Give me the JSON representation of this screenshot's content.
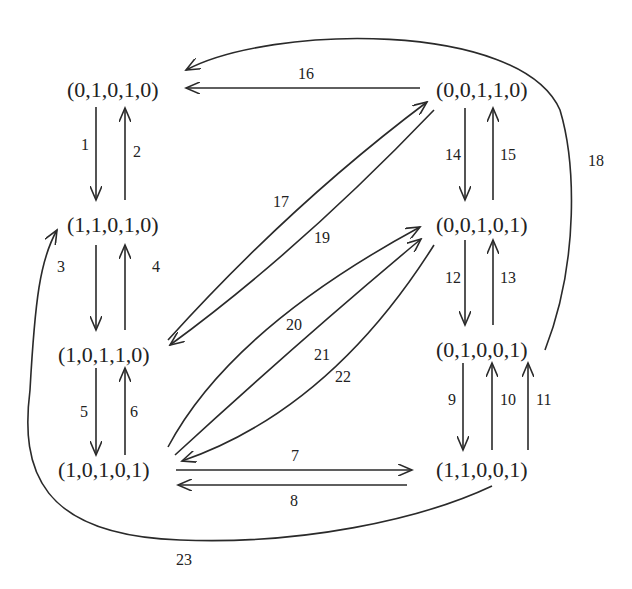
{
  "diagram": {
    "type": "state-transition-graph",
    "nodes": [
      {
        "id": "n01010",
        "label": "(0,1,0,1,0)",
        "x": 140,
        "y": 90
      },
      {
        "id": "n11010",
        "label": "(1,1,0,1,0)",
        "x": 140,
        "y": 225
      },
      {
        "id": "n10110",
        "label": "(1,0,1,1,0)",
        "x": 110,
        "y": 355
      },
      {
        "id": "n10101",
        "label": "(1,0,1,0,1)",
        "x": 110,
        "y": 470
      },
      {
        "id": "n00110",
        "label": "(0,0,1,1,0)",
        "x": 490,
        "y": 90
      },
      {
        "id": "n00101",
        "label": "(0,0,1,0,1)",
        "x": 490,
        "y": 225
      },
      {
        "id": "n01001",
        "label": "(0,1,0,0,1)",
        "x": 490,
        "y": 350
      },
      {
        "id": "n11001",
        "label": "(1,1,0,0,1)",
        "x": 490,
        "y": 470
      }
    ],
    "edges": [
      {
        "id": 1,
        "label": "1",
        "from": "(0,1,0,1,0)",
        "to": "(1,1,0,1,0)"
      },
      {
        "id": 2,
        "label": "2",
        "from": "(1,1,0,1,0)",
        "to": "(0,1,0,1,0)"
      },
      {
        "id": 3,
        "label": "3",
        "from": "(1,1,0,0,1)",
        "to": "(1,1,0,1,0)"
      },
      {
        "id": 4,
        "label": "4",
        "from": "(1,0,1,1,0)",
        "to": "(1,1,0,1,0)"
      },
      {
        "id": 5,
        "label": "5",
        "from": "(1,0,1,1,0)",
        "to": "(1,0,1,0,1)"
      },
      {
        "id": 6,
        "label": "6",
        "from": "(1,0,1,0,1)",
        "to": "(1,0,1,1,0)"
      },
      {
        "id": 7,
        "label": "7",
        "from": "(1,0,1,0,1)",
        "to": "(1,1,0,0,1)"
      },
      {
        "id": 8,
        "label": "8",
        "from": "(1,1,0,0,1)",
        "to": "(1,0,1,0,1)"
      },
      {
        "id": 9,
        "label": "9",
        "from": "(0,1,0,0,1)",
        "to": "(1,1,0,0,1)"
      },
      {
        "id": 10,
        "label": "10",
        "from": "(1,1,0,0,1)",
        "to": "(0,1,0,0,1)"
      },
      {
        "id": 11,
        "label": "11",
        "from": "(1,1,0,0,1)",
        "to": "(0,1,0,0,1)"
      },
      {
        "id": 12,
        "label": "12",
        "from": "(0,0,1,0,1)",
        "to": "(0,1,0,0,1)"
      },
      {
        "id": 13,
        "label": "13",
        "from": "(0,1,0,0,1)",
        "to": "(0,0,1,0,1)"
      },
      {
        "id": 14,
        "label": "14",
        "from": "(0,0,1,1,0)",
        "to": "(0,0,1,0,1)"
      },
      {
        "id": 15,
        "label": "15",
        "from": "(0,0,1,0,1)",
        "to": "(0,0,1,1,0)"
      },
      {
        "id": 16,
        "label": "16",
        "from": "(0,0,1,1,0)",
        "to": "(0,1,0,1,0)"
      },
      {
        "id": 17,
        "label": "17",
        "from": "(1,0,1,1,0)",
        "to": "(0,0,1,1,0)"
      },
      {
        "id": 18,
        "label": "18",
        "from": "(0,1,0,0,1)",
        "to": "(0,1,0,1,0)"
      },
      {
        "id": 19,
        "label": "19",
        "from": "(0,0,1,1,0)",
        "to": "(1,0,1,1,0)"
      },
      {
        "id": 20,
        "label": "20",
        "from": "(1,0,1,0,1)",
        "to": "(0,0,1,0,1)"
      },
      {
        "id": 21,
        "label": "21",
        "from": "(1,0,1,0,1)",
        "to": "(0,0,1,0,1)"
      },
      {
        "id": 22,
        "label": "22",
        "from": "(0,0,1,0,1)",
        "to": "(1,0,1,0,1)"
      },
      {
        "id": 23,
        "label": "23",
        "from": "(1,1,0,0,1)",
        "to": "(1,1,0,1,0)"
      }
    ]
  },
  "nodes": {
    "n01010": "(0,1,0,1,0)",
    "n11010": "(1,1,0,1,0)",
    "n10110": "(1,0,1,1,0)",
    "n10101": "(1,0,1,0,1)",
    "n00110": "(0,0,1,1,0)",
    "n00101": "(0,0,1,0,1)",
    "n01001": "(0,1,0,0,1)",
    "n11001": "(1,1,0,0,1)"
  },
  "edge_labels": {
    "e1": "1",
    "e2": "2",
    "e3": "3",
    "e4": "4",
    "e5": "5",
    "e6": "6",
    "e7": "7",
    "e8": "8",
    "e9": "9",
    "e10": "10",
    "e11": "11",
    "e12": "12",
    "e13": "13",
    "e14": "14",
    "e15": "15",
    "e16": "16",
    "e17": "17",
    "e18": "18",
    "e19": "19",
    "e20": "20",
    "e21": "21",
    "e22": "22",
    "e23": "23"
  },
  "colors": {
    "stroke": "#2a2a2a",
    "text": "#222222",
    "background": "#ffffff"
  }
}
